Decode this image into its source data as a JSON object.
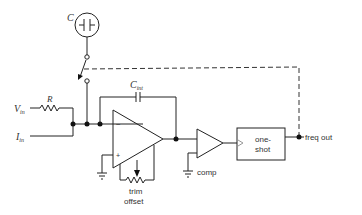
{
  "diagram": {
    "type": "circuit-schematic",
    "labels": {
      "capacitor_c": "C",
      "resistor_r": "R",
      "v_in": "V",
      "v_in_sub": "in",
      "i_in": "I",
      "i_in_sub": "in",
      "c_int": "C",
      "c_int_sub": "int",
      "opamp_minus": "−",
      "opamp_plus": "+",
      "trim_line1": "trim",
      "trim_line2": "offset",
      "comp": "comp",
      "oneshot_line1": "one-",
      "oneshot_line2": "shot",
      "freq_out": "freq out"
    },
    "components": [
      {
        "id": "C",
        "kind": "switched capacitor (circled)"
      },
      {
        "id": "switch",
        "kind": "SPDT switch, controlled by dashed line from output"
      },
      {
        "id": "R",
        "kind": "input resistor"
      },
      {
        "id": "Cint",
        "kind": "integrating capacitor"
      },
      {
        "id": "opamp",
        "kind": "integrator op-amp with trim-offset pot"
      },
      {
        "id": "comp",
        "kind": "comparator"
      },
      {
        "id": "oneshot",
        "kind": "one-shot block"
      }
    ],
    "colors": {
      "line": "#222222",
      "background": "#ffffff"
    }
  }
}
